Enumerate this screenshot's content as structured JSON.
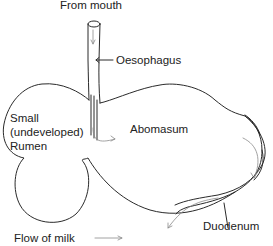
{
  "diagram": {
    "labels": {
      "from_mouth": "From mouth",
      "oesophagus": "Oesophagus",
      "rumen_line1": "Small",
      "rumen_line2": "(undeveloped)",
      "rumen_line3": "Rumen",
      "abomasum": "Abomasum",
      "duodenum": "Duodenum"
    },
    "legend": {
      "flow_of_milk": "Flow of milk"
    },
    "colors": {
      "outline": "#2a2a2a",
      "flow_arrow": "#8a8a8a",
      "text": "#222222"
    }
  }
}
